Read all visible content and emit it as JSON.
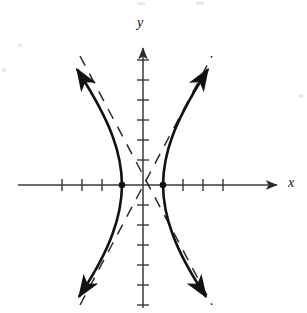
{
  "figure": {
    "kind": "coordinate-plane-graph",
    "width": 307,
    "height": 313,
    "background_color": "#ffffff",
    "ink_color": "#111111",
    "axis_color": "#3a3a3a"
  },
  "axes": {
    "x_label": "x",
    "y_label": "y",
    "x_axis_line": {
      "y": 185,
      "x_start": 18,
      "x_end": 283
    },
    "y_axis_line": {
      "x": 143,
      "y_start": 42,
      "y_end": 308
    },
    "origin": {
      "x": 143,
      "y": 185
    },
    "tick_spacing_px": 20,
    "tick_half_length_px": 6,
    "x_ticks": [
      62,
      82,
      102,
      163,
      183,
      203,
      223
    ],
    "y_ticks": [
      60,
      80,
      100,
      120,
      140,
      160,
      205,
      225,
      245,
      265,
      285,
      305
    ],
    "arrowheads": [
      "x-positive",
      "y-positive"
    ],
    "tick_labels_shown": false,
    "gridlines": false
  },
  "chart_data": {
    "type": "line",
    "title": "",
    "xlabel": "x",
    "ylabel": "y",
    "curve_name": "hyperbola",
    "opens": "left-right",
    "center": {
      "x": 0,
      "y": 0
    },
    "vertices": [
      {
        "x": -1,
        "y": 0,
        "px": 122,
        "py": 185
      },
      {
        "x": 1,
        "y": 0,
        "px": 163,
        "py": 185
      }
    ],
    "semi_axis_a_units": 1,
    "semi_axis_b_units": 1.9,
    "unit_px": 20,
    "asymptote_slopes": [
      1.9,
      -1.9
    ],
    "asymptotes_style": "dashed",
    "branch_style": "solid",
    "branch_arrow_ends": 4,
    "series": [
      {
        "name": "right branch",
        "points_px": [
          [
            163,
            185
          ],
          [
            163.6,
            173
          ],
          [
            165.4,
            161
          ],
          [
            168.3,
            149
          ],
          [
            172.3,
            137
          ],
          [
            177.2,
            125
          ],
          [
            182.9,
            113
          ],
          [
            189.2,
            101
          ],
          [
            196.0,
            89
          ],
          [
            203.2,
            77
          ],
          [
            210.7,
            65
          ]
        ]
      },
      {
        "name": "right branch lower",
        "points_px": [
          [
            163,
            185
          ],
          [
            163.6,
            197
          ],
          [
            165.4,
            209
          ],
          [
            168.3,
            221
          ],
          [
            172.3,
            233
          ],
          [
            177.2,
            245
          ],
          [
            182.9,
            257
          ],
          [
            189.2,
            269
          ],
          [
            196.0,
            281
          ],
          [
            203.2,
            293
          ]
        ]
      },
      {
        "name": "left branch",
        "points_px": [
          [
            122,
            185
          ],
          [
            121.4,
            173
          ],
          [
            119.6,
            161
          ],
          [
            116.7,
            149
          ],
          [
            112.7,
            137
          ],
          [
            107.8,
            125
          ],
          [
            102.1,
            113
          ],
          [
            95.8,
            101
          ],
          [
            89.0,
            89
          ],
          [
            81.8,
            77
          ],
          [
            74.3,
            65
          ]
        ]
      },
      {
        "name": "left branch lower",
        "points_px": [
          [
            122,
            185
          ],
          [
            121.4,
            197
          ],
          [
            119.6,
            209
          ],
          [
            116.7,
            221
          ],
          [
            112.7,
            233
          ],
          [
            107.8,
            245
          ],
          [
            102.1,
            257
          ],
          [
            95.8,
            269
          ],
          [
            89.0,
            281
          ],
          [
            81.8,
            293
          ]
        ]
      }
    ],
    "annotations": [
      {
        "label": "vertex dot left",
        "px": 122,
        "py": 185
      },
      {
        "label": "vertex dot right",
        "px": 163,
        "py": 185
      }
    ],
    "legend": [],
    "legend_position": "none"
  },
  "artifacts": {
    "scan_specks": [
      {
        "x": 137,
        "y": 2,
        "w": 8,
        "h": 3
      },
      {
        "x": 196,
        "y": 2,
        "w": 8,
        "h": 3
      },
      {
        "x": 2,
        "y": 68,
        "w": 4,
        "h": 4
      },
      {
        "x": 299,
        "y": 94,
        "w": 4,
        "h": 4
      },
      {
        "x": 18,
        "y": 44,
        "w": 4,
        "h": 3
      }
    ]
  }
}
